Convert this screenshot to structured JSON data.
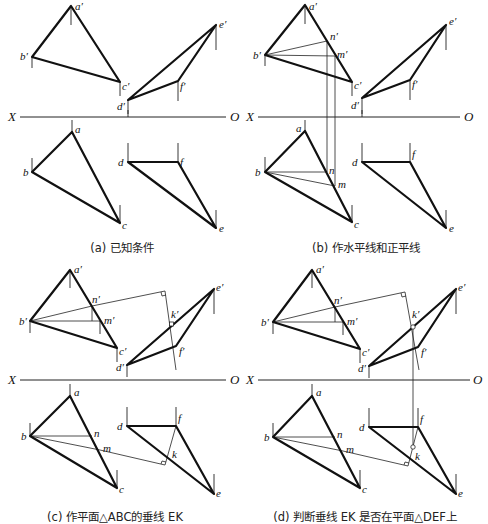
{
  "figure": {
    "panels": [
      {
        "id": "a",
        "caption": "(a) 已知条件",
        "axis": {
          "left": "X",
          "right": "O"
        },
        "labels": {
          "a1": "a′",
          "b1": "b′",
          "c1": "c′",
          "d1": "d′",
          "e1": "e′",
          "f1": "f′",
          "a": "a",
          "b": "b",
          "c": "c",
          "d": "d",
          "e": "e",
          "f": "f"
        }
      },
      {
        "id": "b",
        "caption": "(b) 作水平线和正平线",
        "axis": {
          "left": "X",
          "right": "O"
        },
        "labels": {
          "a1": "a′",
          "b1": "b′",
          "c1": "c′",
          "d1": "d′",
          "e1": "e′",
          "f1": "f′",
          "n1": "n′",
          "m1": "m′",
          "a": "a",
          "b": "b",
          "c": "c",
          "d": "d",
          "e": "e",
          "f": "f",
          "n": "n",
          "m": "m"
        }
      },
      {
        "id": "c",
        "caption": "(c) 作平面△ABC的垂线 EK",
        "axis": {
          "left": "X",
          "right": "O"
        },
        "labels": {
          "a1": "a′",
          "b1": "b′",
          "c1": "c′",
          "d1": "d′",
          "e1": "e′",
          "f1": "f′",
          "n1": "n′",
          "m1": "m′",
          "k1": "k′",
          "a": "a",
          "b": "b",
          "c": "c",
          "d": "d",
          "e": "e",
          "f": "f",
          "n": "n",
          "m": "m",
          "k": "k"
        }
      },
      {
        "id": "d",
        "caption": "(d) 判断垂线 EK 是否在平面△DEF上",
        "axis": {
          "left": "X",
          "right": "O"
        },
        "labels": {
          "a1": "a′",
          "b1": "b′",
          "c1": "c′",
          "d1": "d′",
          "e1": "e′",
          "f1": "f′",
          "n1": "n′",
          "m1": "m′",
          "k1": "k′",
          "a": "a",
          "b": "b",
          "c": "c",
          "d": "d",
          "e": "e",
          "f": "f",
          "n": "n",
          "m": "m",
          "k": "k"
        }
      }
    ]
  }
}
